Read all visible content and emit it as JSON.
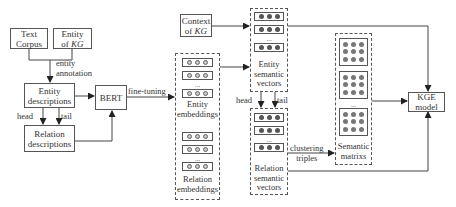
{
  "nodes": {
    "text_corpus": "Text\nCorpus",
    "entity_of_kg_line1": "Entity",
    "entity_of_kg_line2_pre": "of ",
    "entity_of_kg_line2_it": "KG",
    "entity_descriptions": [
      "Entity",
      "descriptions"
    ],
    "relation_descriptions": [
      "Relation",
      "descriptions"
    ],
    "bert": "BERT",
    "context_line1": "Context",
    "context_line2_pre": "of ",
    "context_line2_it": "KG",
    "kge_model": [
      "KGE",
      "model"
    ]
  },
  "groups": {
    "entity_embeddings": [
      "Entity",
      "embeddings"
    ],
    "relation_embeddings": [
      "Relation",
      "embeddings"
    ],
    "entity_semantic_vectors": [
      "Entity",
      "semantic",
      "vectors"
    ],
    "relation_semantic_vectors": [
      "Relation",
      "semantic",
      "vectors"
    ],
    "semantic_matrixs": [
      "Semantic",
      "matrixs"
    ]
  },
  "edge_labels": {
    "entity_annotation": [
      "entity",
      "annotation"
    ],
    "fine_tuning": "fine-tuning",
    "head": "head",
    "tail": "tail",
    "head2": "head",
    "tail2": "tail",
    "clustering_triples": [
      "clustering",
      "triples"
    ]
  },
  "ellipsis": "...",
  "colors": {
    "line": "#444444",
    "dot_open": "#c8c8c8",
    "dot_filled": "#555555"
  }
}
